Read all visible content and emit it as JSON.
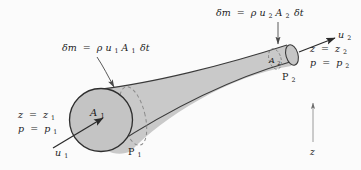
{
  "figure": {
    "type": "fluid-flow-stream-tube-diagram",
    "caption_text": "",
    "background_color": "#fbfbfb",
    "tube_fill_color": "#c9c9c9",
    "tube_stroke_color": "#3a3a3a",
    "dashed_stroke_color": "#8a8a8a",
    "text_color": "#1b1b1b"
  },
  "labels": {
    "mass_flux_inlet": {
      "text": "δm = ρu₁A₁δt",
      "parts": {
        "lhs": "δm",
        "eq": "=",
        "rho": "ρ",
        "u": "u",
        "u_sub": "1",
        "A": "A",
        "A_sub": "1",
        "dt": "δt"
      }
    },
    "mass_flux_outlet": {
      "text": "δm = ρu₂A₂δt",
      "parts": {
        "lhs": "δm",
        "eq": "=",
        "rho": "ρ",
        "u": "u",
        "u_sub": "2",
        "A": "A",
        "A_sub": "2",
        "dt": "δt"
      }
    },
    "inlet_state": {
      "height_line": {
        "var": "z",
        "eq": "=",
        "value_var": "z",
        "value_sub": "1"
      },
      "pressure_line": {
        "var": "p",
        "eq": "=",
        "value_var": "p",
        "value_sub": "1"
      }
    },
    "outlet_state": {
      "height_line": {
        "var": "z",
        "eq": "=",
        "value_var": "z",
        "value_sub": "2"
      },
      "pressure_line": {
        "var": "p",
        "eq": "=",
        "value_var": "p",
        "value_sub": "2"
      }
    },
    "inlet_velocity": {
      "var": "u",
      "sub": "1"
    },
    "outlet_velocity": {
      "var": "u",
      "sub": "2"
    },
    "inlet_area": {
      "var": "A",
      "sub": "1"
    },
    "outlet_area": {
      "var": "A",
      "sub": "2"
    },
    "inlet_point": {
      "var": "P",
      "sub": "1"
    },
    "outlet_point": {
      "var": "P",
      "sub": "2"
    },
    "vertical_axis": {
      "var": "z"
    }
  },
  "geometry": {
    "inlet_circle": {
      "cx": 101,
      "cy": 121,
      "r": 32
    },
    "inlet_dashed_ellipse": {
      "cx": 131,
      "cy": 117,
      "rx": 12,
      "ry": 31
    },
    "outlet_ellipse": {
      "cx": 292,
      "cy": 56,
      "rx": 6,
      "ry": 11
    },
    "outlet_dashed_ellipse": {
      "cx": 275,
      "cy": 60,
      "rx": 6,
      "ry": 11
    }
  }
}
